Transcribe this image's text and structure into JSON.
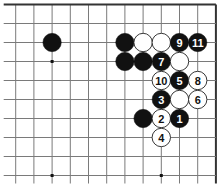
{
  "board": {
    "origin_x": 15.7,
    "origin_y": 4.5,
    "spacing_x": 18.2,
    "spacing_y": 19.0,
    "cols": 12,
    "rows": 10,
    "line_bottom_extend": 8,
    "line_left_extend": 12,
    "edge_top": true,
    "edge_right": true,
    "stone_radius": 9.2,
    "colors": {
      "line": "#7a7a7a",
      "edge": "#333333",
      "black": "#111111",
      "white": "#ffffff",
      "white_stroke": "#222222",
      "star": "#111111"
    },
    "star_points": [
      {
        "col": 2,
        "row": 3
      },
      {
        "col": 2,
        "row": 9
      },
      {
        "col": 8,
        "row": 9
      }
    ],
    "stones": [
      {
        "col": 2,
        "row": 2,
        "color": "black",
        "label": ""
      },
      {
        "col": 6,
        "row": 2,
        "color": "black",
        "label": ""
      },
      {
        "col": 7,
        "row": 2,
        "color": "white",
        "label": ""
      },
      {
        "col": 8,
        "row": 2,
        "color": "white",
        "label": ""
      },
      {
        "col": 9,
        "row": 2,
        "color": "black",
        "label": "9"
      },
      {
        "col": 10,
        "row": 2,
        "color": "black",
        "label": "11"
      },
      {
        "col": 6,
        "row": 3,
        "color": "black",
        "label": ""
      },
      {
        "col": 7,
        "row": 3,
        "color": "black",
        "label": ""
      },
      {
        "col": 8,
        "row": 3,
        "color": "black",
        "label": "7"
      },
      {
        "col": 9,
        "row": 3,
        "color": "white",
        "label": ""
      },
      {
        "col": 8,
        "row": 4,
        "color": "white",
        "label": "10"
      },
      {
        "col": 9,
        "row": 4,
        "color": "black",
        "label": "5"
      },
      {
        "col": 10,
        "row": 4,
        "color": "white",
        "label": "8"
      },
      {
        "col": 8,
        "row": 5,
        "color": "black",
        "label": "3"
      },
      {
        "col": 9,
        "row": 5,
        "color": "white",
        "label": ""
      },
      {
        "col": 10,
        "row": 5,
        "color": "white",
        "label": "6"
      },
      {
        "col": 7,
        "row": 6,
        "color": "black",
        "label": ""
      },
      {
        "col": 8,
        "row": 6,
        "color": "white",
        "label": "2"
      },
      {
        "col": 9,
        "row": 6,
        "color": "black",
        "label": "1"
      },
      {
        "col": 8,
        "row": 7,
        "color": "white",
        "label": "4"
      }
    ]
  }
}
